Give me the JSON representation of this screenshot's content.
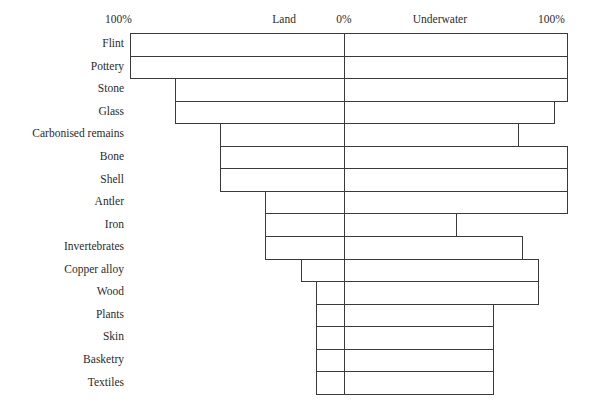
{
  "chart_data": {
    "type": "bar",
    "subtype": "diverging-horizontal-bar",
    "title": "",
    "xlabel": "",
    "ylabel": "",
    "axis_labels": {
      "left_end": "100%",
      "left_side": "Land",
      "center": "0%",
      "right_side": "Underwater",
      "right_end": "100%"
    },
    "axis": {
      "left_max_percent": 100,
      "right_max_percent": 100,
      "center_percent": 0,
      "grid": false,
      "legend": false
    },
    "categories": [
      "Flint",
      "Pottery",
      "Stone",
      "Glass",
      "Carbonised remains",
      "Bone",
      "Shell",
      "Antler",
      "Iron",
      "Invertebrates",
      "Copper alloy",
      "Wood",
      "Plants",
      "Skin",
      "Basketry",
      "Textiles"
    ],
    "series": [
      {
        "name": "Land",
        "direction": "left",
        "values": [
          100,
          100,
          79,
          79,
          58,
          58,
          58,
          37,
          37,
          37,
          20,
          13,
          13,
          13,
          13,
          13
        ]
      },
      {
        "name": "Underwater",
        "direction": "right",
        "values": [
          100,
          100,
          100,
          94,
          78,
          100,
          100,
          100,
          50,
          80,
          87,
          87,
          67,
          67,
          67,
          67
        ]
      }
    ],
    "colors": {
      "bar_stroke": "#3a3a3a",
      "bar_fill": "none",
      "text": "#2b2b2b",
      "background": "#ffffff"
    }
  },
  "geometry": {
    "center_x": 344,
    "left_100_x": 130,
    "right_100_x": 567,
    "first_row_top_y": 33,
    "row_height": 22.55,
    "header_y": 20
  }
}
